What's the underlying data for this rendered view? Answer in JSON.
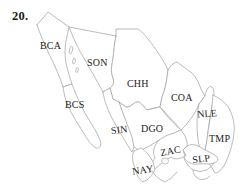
{
  "question_number": "20.",
  "map": {
    "colors": {
      "background": "#ffffff",
      "border_line": "#a9a9a9",
      "label_text": "#1b1b1b"
    },
    "state_labels": [
      {
        "abbr": "BCA"
      },
      {
        "abbr": "SON"
      },
      {
        "abbr": "CHH"
      },
      {
        "abbr": "BCS"
      },
      {
        "abbr": "SIN"
      },
      {
        "abbr": "DGO"
      },
      {
        "abbr": "COA"
      },
      {
        "abbr": "NLE"
      },
      {
        "abbr": "TMP"
      },
      {
        "abbr": "ZAC"
      },
      {
        "abbr": "SLP"
      },
      {
        "abbr": "NAY"
      }
    ]
  }
}
